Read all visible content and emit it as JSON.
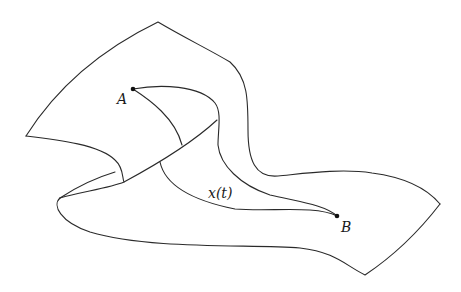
{
  "diagram": {
    "points": [
      {
        "id": "A",
        "label": "A",
        "x": 133,
        "y": 89
      },
      {
        "id": "B",
        "label": "B",
        "x": 337,
        "y": 216
      }
    ],
    "path_label": "x(t)",
    "colors": {
      "stroke": "#2a2a2a",
      "background": "#ffffff"
    }
  }
}
